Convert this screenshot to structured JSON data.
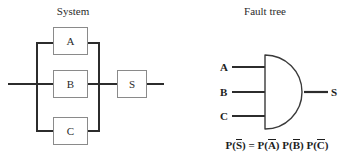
{
  "diagram": {
    "panels": {
      "system": {
        "title": "System",
        "blocks": [
          {
            "id": "A",
            "label": "A"
          },
          {
            "id": "B",
            "label": "B"
          },
          {
            "id": "C",
            "label": "C"
          },
          {
            "id": "S",
            "label": "S"
          }
        ],
        "topology": "three components A, B and C connected in parallel, feeding block S in series",
        "input_line": true,
        "output_line": true
      },
      "fault_tree": {
        "title": "Fault tree",
        "gate": {
          "type": "AND",
          "inputs": [
            "A",
            "B",
            "C"
          ],
          "output": "S"
        },
        "formula": {
          "lhs_fn": "P(",
          "lhs_var": "S",
          "lhs_close": ")",
          "equals": "=",
          "terms": [
            {
              "fn": "P(",
              "var": "A",
              "close": ")"
            },
            {
              "fn": "P(",
              "var": "B",
              "close": ")"
            },
            {
              "fn": "P(",
              "var": "C",
              "close": ")"
            }
          ],
          "plain_text": "P(S̅) = P(A̅) P(B̅) P(C̅)"
        }
      }
    },
    "colors": {
      "wire": "#2c2c2c",
      "block_border": "#8a8a8a",
      "text": "#1e1e1e",
      "background": "#ffffff"
    }
  }
}
